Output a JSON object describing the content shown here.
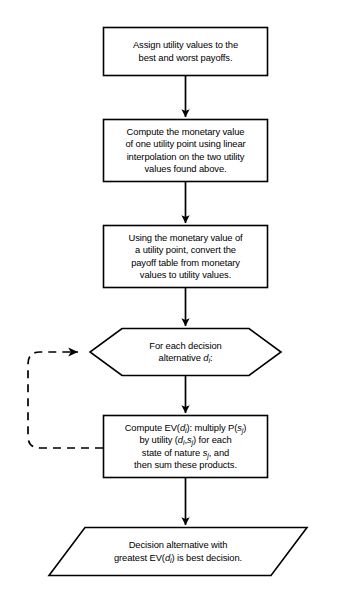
{
  "diagram": {
    "stroke_color": "#000000",
    "background_color": "#ffffff",
    "nodes": [
      {
        "id": "step-assign-utility-values",
        "shape": "process",
        "lines": [
          "Assign utility values to the",
          "best and worst payoffs."
        ]
      },
      {
        "id": "step-compute-monetary-value",
        "shape": "process",
        "lines": [
          "Compute the monetary value",
          "of one utility point using linear",
          "interpolation on the two utility",
          "values found above."
        ]
      },
      {
        "id": "step-convert-payoff-table",
        "shape": "process",
        "lines": [
          "Using the monetary value of",
          "a utility point, convert the",
          "payoff table from monetary",
          "values to utility values."
        ]
      },
      {
        "id": "step-for-each-decision-alternative",
        "shape": "preparation-hexagon",
        "lines": [
          "For each decision",
          "alternative d<sub>i</sub>:"
        ]
      },
      {
        "id": "step-compute-expected-value",
        "shape": "process",
        "lines": [
          "Compute EV(d<sub>i</sub>): multiply P(s<sub>j</sub>)",
          "by utility (d<sub>i</sub>,s<sub>j</sub>) for each",
          "state of nature s<sub>j</sub>, and",
          "then sum these products."
        ]
      },
      {
        "id": "step-best-decision-output",
        "shape": "parallelogram",
        "lines": [
          "Decision alternative with",
          "greatest EV(d<sub>i</sub>) is best decision."
        ]
      }
    ],
    "connectors": [
      {
        "id": "arrow-assign-to-compute",
        "style": "solid",
        "direction": "down"
      },
      {
        "id": "arrow-compute-to-convert",
        "style": "solid",
        "direction": "down"
      },
      {
        "id": "arrow-convert-to-foreach",
        "style": "solid",
        "direction": "down"
      },
      {
        "id": "arrow-foreach-to-ev",
        "style": "solid",
        "direction": "down"
      },
      {
        "id": "arrow-ev-to-output",
        "style": "solid",
        "direction": "down"
      },
      {
        "id": "loop-ev-back-to-foreach",
        "style": "dashed",
        "direction": "left-up-right"
      }
    ]
  }
}
